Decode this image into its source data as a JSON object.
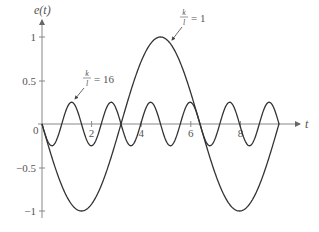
{
  "chart_data": {
    "type": "line",
    "title": "",
    "xlabel": "t",
    "ylabel": "e(t)",
    "xlim": [
      0,
      9.6
    ],
    "ylim": [
      -1,
      1
    ],
    "grid": false,
    "x_ticks": [
      "0",
      "2",
      "4",
      "6",
      "8"
    ],
    "x_tick_values": [
      0,
      2,
      4,
      6,
      8
    ],
    "y_ticks": [
      "1",
      "0.5",
      "-0.5",
      "-1"
    ],
    "y_tick_values": [
      1,
      0.5,
      -0.5,
      -1
    ],
    "series": [
      {
        "name": "k/l = 1",
        "formula": "-sin(2*pi*t/6.37)",
        "amplitude": 1,
        "period": 6.37,
        "x": [
          0,
          1.6,
          3.2,
          4.8,
          6.4,
          8.0,
          9.56
        ],
        "values": [
          0,
          -1,
          0,
          1,
          0,
          -1,
          0
        ]
      },
      {
        "name": "k/l = 16",
        "formula": "-0.25*sin(2*pi*t/1.593)",
        "amplitude": 0.25,
        "period": 1.593,
        "x": [
          0,
          0.4,
          0.8,
          1.2,
          1.6,
          2.0,
          2.4,
          2.8,
          3.2,
          3.6,
          4.0,
          4.4,
          4.8,
          5.2,
          5.6,
          6.0,
          6.4,
          6.8,
          7.2,
          7.6,
          8.0,
          8.4,
          8.8,
          9.2,
          9.56
        ],
        "values": [
          0,
          -0.25,
          0,
          0.25,
          0,
          -0.25,
          0,
          0.25,
          0,
          -0.25,
          0,
          0.25,
          0,
          -0.25,
          0,
          0.25,
          0,
          -0.25,
          0,
          0.25,
          0,
          -0.25,
          0,
          0.25,
          0
        ]
      }
    ],
    "annotations": [
      {
        "text_num": "k",
        "text_den": "l",
        "text_rest": "= 16",
        "points_to_series": "k/l = 16"
      },
      {
        "text_num": "k",
        "text_den": "l",
        "text_rest": "= 1",
        "points_to_series": "k/l = 1"
      }
    ]
  },
  "labels": {
    "ylabel": "e(t)",
    "xlabel": "t",
    "origin": "0",
    "x2": "2",
    "x4": "4",
    "x6": "6",
    "x8": "8",
    "y1": "1",
    "y05": "0.5",
    "ym05": "−0.5",
    "ym1": "−1",
    "ann16_num": "k",
    "ann16_den": "l",
    "ann16_rest": "= 16",
    "ann1_num": "k",
    "ann1_den": "l",
    "ann1_rest": "= 1"
  }
}
